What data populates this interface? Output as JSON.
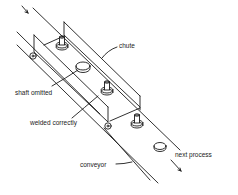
{
  "diagram": {
    "type": "isometric line drawing",
    "labels": {
      "chute": "chute",
      "shaft_omitted": "shaft omitted",
      "welded_correctly": "welded correctly",
      "conveyor": "conveyor",
      "next_process": "next process"
    },
    "colors": {
      "line": "#1a1a1a",
      "background": "#ffffff"
    }
  }
}
